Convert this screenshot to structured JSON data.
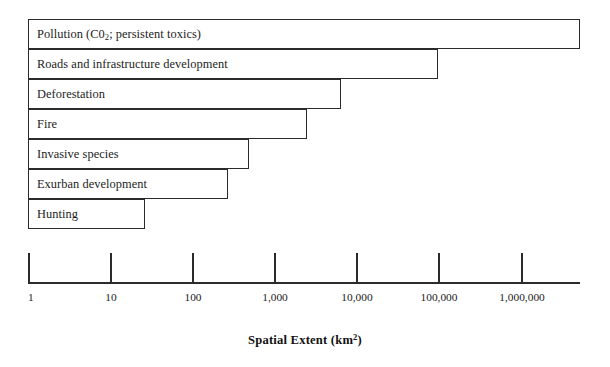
{
  "chart_data": {
    "type": "bar",
    "orientation": "horizontal",
    "title": "",
    "xlabel": "Spatial Extent (km2)",
    "xlabel_parts": {
      "text": "Spatial Extent (km",
      "sup": "2",
      "tail": ")"
    },
    "ylabel": "",
    "xscale": "log",
    "xlim": [
      1,
      5000000
    ],
    "grid": false,
    "legend": false,
    "axis_tick_labels": [
      "1",
      "10",
      "100",
      "1,000",
      "10,000",
      "100,000",
      "1,000,000"
    ],
    "axis_tick_values": [
      1,
      10,
      100,
      1000,
      10000,
      100000,
      1000000
    ],
    "categories": [
      "Pollution (C02; persistent toxics)",
      "Roads and infrastructure development",
      "Deforestation",
      "Fire",
      "Invasive species",
      "Exurban development",
      "Hunting"
    ],
    "values": [
      5000000,
      100000,
      6000,
      2500,
      500,
      250,
      25
    ],
    "bars": [
      {
        "label_prefix": "Pollution (C0",
        "label_sub": "2",
        "label_suffix": "; persistent toxics)",
        "label": "Pollution (C02; persistent toxics)",
        "value": 5000000,
        "value_text": "5,000,000",
        "x_start_px": 28,
        "x_end_px": 580,
        "y_px": 19
      },
      {
        "label": "Roads and infrastructure development",
        "value": 100000,
        "value_text": "100,000",
        "x_start_px": 28,
        "x_end_px": 438,
        "y_px": 49
      },
      {
        "label": "Deforestation",
        "value": 6000,
        "value_text": "6,000",
        "x_start_px": 28,
        "x_end_px": 341,
        "y_px": 79
      },
      {
        "label": "Fire",
        "value": 2500,
        "value_text": "2,500",
        "x_start_px": 28,
        "x_end_px": 307,
        "y_px": 109
      },
      {
        "label": "Invasive species",
        "value": 500,
        "value_text": "500",
        "x_start_px": 28,
        "x_end_px": 249,
        "y_px": 139
      },
      {
        "label": "Exurban development",
        "value": 250,
        "value_text": "250",
        "x_start_px": 28,
        "x_end_px": 228,
        "y_px": 169
      },
      {
        "label": "Hunting",
        "value": 25,
        "value_text": "25",
        "x_start_px": 28,
        "x_end_px": 145,
        "y_px": 199
      }
    ],
    "axis": {
      "line_start_px": 28,
      "line_end_px": 580,
      "baseline_y_px": 282,
      "ticks": [
        {
          "label": "1",
          "value": 1,
          "x_px": 28
        },
        {
          "label": "10",
          "value": 10,
          "x_px": 110
        },
        {
          "label": "100",
          "value": 100,
          "x_px": 192
        },
        {
          "label": "1,000",
          "value": 1000,
          "x_px": 274
        },
        {
          "label": "10,000",
          "value": 10000,
          "x_px": 356
        },
        {
          "label": "100,000",
          "value": 100000,
          "x_px": 438
        },
        {
          "label": "1,000,000",
          "value": 1000000,
          "x_px": 521
        }
      ]
    },
    "colors": {
      "bar_fill": "#ffffff",
      "bar_stroke": "#2b2b2b",
      "axis": "#2b2b2b",
      "text": "#1d1d1d",
      "background": "#ffffff"
    }
  }
}
